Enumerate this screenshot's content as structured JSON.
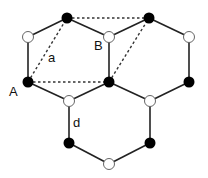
{
  "labels": {
    "A": "A",
    "B": "B",
    "a": "a",
    "d": "d"
  },
  "colors": {
    "filled_atom": "#000000",
    "open_atom": "#ffffff",
    "bond": "#222222"
  }
}
